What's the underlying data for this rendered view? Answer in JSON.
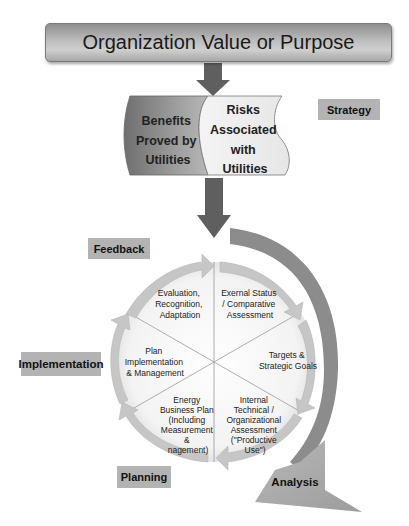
{
  "title": "Organization Value or Purpose",
  "scrolls": {
    "left": [
      "Benefits",
      "Proved by",
      "Utilities"
    ],
    "right": [
      "Risks",
      "Associated",
      "with",
      "Utilities"
    ]
  },
  "stage_labels": {
    "strategy": "Strategy",
    "feedback": "Feedback",
    "implementation": "Implementation",
    "planning": "Planning",
    "analysis": "Analysis"
  },
  "cycle_segments": [
    {
      "id": "evaluation",
      "lines": [
        "Evaluation,",
        "Recognition,",
        "Adaptation"
      ]
    },
    {
      "id": "external-status",
      "lines": [
        "Exernal Status",
        "/ Comparative",
        "Assessment"
      ]
    },
    {
      "id": "targets",
      "lines": [
        "Targets &",
        "Strategic Goals"
      ]
    },
    {
      "id": "internal-assessment",
      "lines": [
        "Internal",
        "Technical /",
        "Organizational",
        "Assessment",
        "(\"Productive",
        "Use\")"
      ]
    },
    {
      "id": "energy-business-plan",
      "lines": [
        "Energy",
        "Business Plan",
        "(Including",
        "Measurement",
        "&",
        "nagement)"
      ]
    },
    {
      "id": "plan-implementation",
      "lines": [
        "Plan",
        "Implementation",
        "& Management"
      ]
    }
  ],
  "colors": {
    "banner": "#b0b0b0",
    "arrow_dark": "#5f5f5f",
    "label_bg": "#b3b3b3",
    "cycle_arrow": "#c4c4c4",
    "outer_arc": "#8a8a8a",
    "analysis_arrow": "#a9a9a9"
  }
}
